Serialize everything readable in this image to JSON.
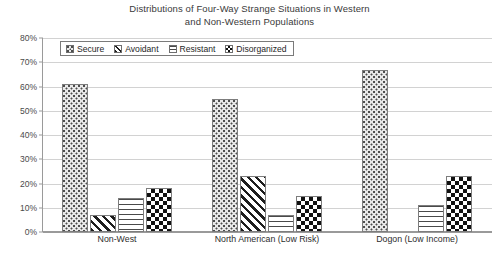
{
  "chart_data": {
    "type": "bar",
    "title": "Distributions of Four-Way Strange Situations in Western and Non-Western Populations",
    "title_line1": "Distributions of Four-Way Strange Situations in Western",
    "title_line2": "and Non-Western Populations",
    "xlabel": "",
    "ylabel": "",
    "ylim": [
      0,
      80
    ],
    "ytick_labels": [
      "80%",
      "70%",
      "60%",
      "50%",
      "40%",
      "30%",
      "20%",
      "10%",
      "0%"
    ],
    "ytick_values": [
      80,
      70,
      60,
      50,
      40,
      30,
      20,
      10,
      0
    ],
    "grid": true,
    "legend_position": "top-left-inside",
    "categories": [
      "Non-West",
      "North American (Low Risk)",
      "Dogon (Low Income)"
    ],
    "series": [
      {
        "name": "Secure",
        "pattern": "dotted",
        "values": [
          61,
          55,
          67
        ]
      },
      {
        "name": "Avoidant",
        "pattern": "diagonal",
        "values": [
          7,
          23,
          0
        ]
      },
      {
        "name": "Resistant",
        "pattern": "horizontal",
        "values": [
          14,
          7,
          11
        ]
      },
      {
        "name": "Disorganized",
        "pattern": "checkerboard",
        "values": [
          18,
          15,
          23
        ]
      }
    ]
  },
  "legend": {
    "items": [
      {
        "label": "Secure"
      },
      {
        "label": "Avoidant"
      },
      {
        "label": "Resistant"
      },
      {
        "label": "Disorganized"
      }
    ]
  },
  "colors": {
    "axis": "#9a9a9a",
    "grid": "#d2d2d2",
    "text": "#2b2b2b",
    "bar_outline": "#7d7d7d",
    "background": "#ffffff"
  }
}
